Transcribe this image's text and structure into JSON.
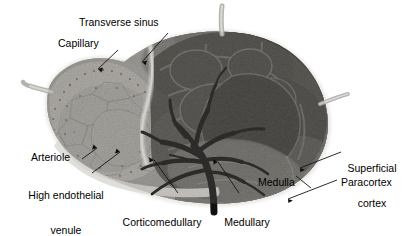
{
  "figure": {
    "type": "labeled-micrograph",
    "width": 408,
    "height": 236,
    "background_color": "#ffffff",
    "ink_color": "#000000"
  },
  "labels": [
    {
      "id": "transverse-sinus",
      "text": "Transverse sinus",
      "lines": [
        "Transverse sinus"
      ]
    },
    {
      "id": "capillary",
      "text": "Capillary",
      "lines": [
        "Capillary"
      ]
    },
    {
      "id": "arteriole",
      "text": "Arteriole",
      "lines": [
        "Arteriole"
      ]
    },
    {
      "id": "high-endothelial-venule",
      "text": "High endothelial venule",
      "lines": [
        "High endothelial",
        "venule"
      ]
    },
    {
      "id": "corticomedullary-junction",
      "text": "Corticomedullary junction",
      "lines": [
        "Corticomedullary",
        "junction"
      ]
    },
    {
      "id": "medullary-venule",
      "text": "Medullary venule",
      "lines": [
        "Medullary",
        "venule"
      ]
    },
    {
      "id": "superficial-cortex",
      "text": "Superficial cortex",
      "lines": [
        "Superficial",
        "cortex"
      ]
    },
    {
      "id": "medulla",
      "text": "Medulla",
      "lines": [
        "Medulla"
      ]
    },
    {
      "id": "paracortex",
      "text": "Paracortex",
      "lines": [
        "Paracortex"
      ]
    }
  ],
  "label_text": {
    "transverse_sinus": "Transverse sinus",
    "capillary": "Capillary",
    "arteriole": "Arteriole",
    "high_endothelial_venule_l1": "High endothelial",
    "high_endothelial_venule_l2": "venule",
    "corticomedullary_junction_l1": "Corticomedullary",
    "corticomedullary_junction_l2": "junction",
    "medullary_venule_l1": "Medullary",
    "medullary_venule_l2": "venule",
    "superficial_cortex_l1": "Superficial",
    "superficial_cortex_l2": "cortex",
    "medulla": "Medulla",
    "paracortex": "Paracortex"
  },
  "palette": {
    "capsule": "#cfcdc9",
    "cortex_light": "#b9b7b2",
    "cortex_mid": "#8e8c88",
    "cortex_dark": "#3a3936",
    "follicle_dark": "#171716",
    "medulla": "#7d7b77",
    "vessel_dark": "#0f0f0e",
    "sinus_pale": "#e3e1dd",
    "leader_line": "#1a1a1a"
  }
}
